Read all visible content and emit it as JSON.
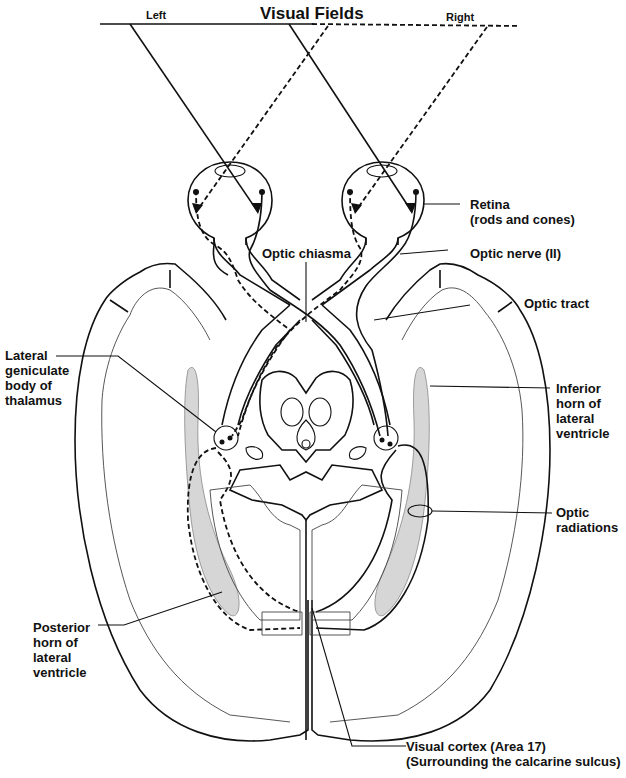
{
  "diagram": {
    "title": "Visual Fields",
    "field_labels": {
      "left": "Left",
      "right": "Right"
    },
    "labels": {
      "retina": "Retina\n(rods and cones)",
      "optic_chiasma": "Optic chiasma",
      "optic_nerve": "Optic nerve (II)",
      "optic_tract": "Optic tract",
      "lateral_geniculate": "Lateral\ngeniculate\nbody of\nthalamus",
      "inferior_horn": "Inferior\nhorn of\nlateral\nventricle",
      "optic_radiations": "Optic\nradiations",
      "posterior_horn": "Posterior\nhorn of\nlateral\nventricle",
      "visual_cortex": "Visual cortex (Area 17)\n(Surrounding the calcarine sulcus)"
    },
    "legend": {
      "solid_line": "Left visual field pathway",
      "dashed_line": "Right visual field pathway"
    },
    "colors": {
      "line": "#111111",
      "ventricle_fill": "#d6d6d6",
      "background": "#ffffff"
    }
  }
}
